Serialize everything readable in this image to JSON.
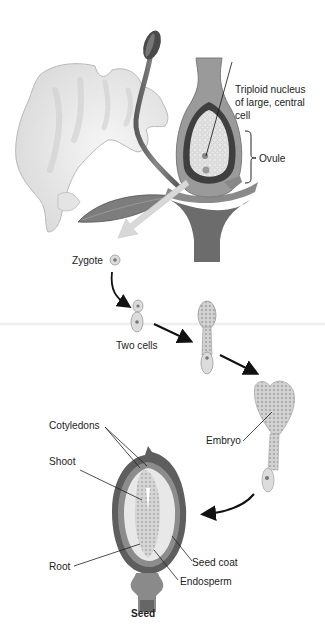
{
  "diagram": {
    "type": "biology-illustration",
    "labels": {
      "triploid_line1": "Triploid nucleus",
      "triploid_line2": "of large, central",
      "triploid_line3": "cell",
      "ovule": "Ovule",
      "zygote": "Zygote",
      "two_cells": "Two cells",
      "embryo": "Embryo",
      "cotyledons": "Cotyledons",
      "shoot": "Shoot",
      "root": "Root",
      "seed_coat": "Seed coat",
      "endosperm": "Endosperm",
      "seed": "Seed"
    },
    "stages": [
      "Flower with ovule",
      "Zygote",
      "Two cells",
      "Embryo",
      "Seed"
    ],
    "colors": {
      "petal": "#ececec",
      "petal_shade": "#d4d4d4",
      "stem_dark": "#6f6f6f",
      "ovary_wall": "#9a9a9a",
      "ovule_dark": "#444444",
      "cell_fill": "#dcdcdc",
      "embryo_fill": "#d6d6d6",
      "seed_coat": "#5e5e5e",
      "endosperm": "#e6e6e6",
      "arrow": "#111111",
      "text": "#222222"
    }
  }
}
